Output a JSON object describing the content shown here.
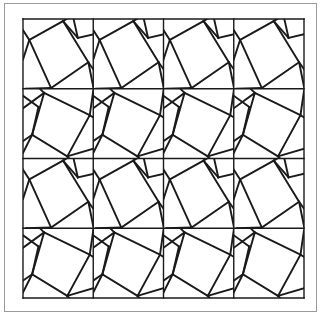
{
  "figure": {
    "background_color": "#ffffff",
    "line_color": "#1a1a1a",
    "frame_color": "#9a9a9a",
    "outer_frame": {
      "x": 4,
      "y": 3,
      "width": 313,
      "height": 309,
      "stroke_width": 1
    },
    "grid": {
      "x": 23,
      "y": 19,
      "width": 281,
      "height": 279,
      "columns": 4,
      "rows": 4,
      "cell_width": 70.25,
      "cell_height": 69.75,
      "stroke_width": 1.4
    },
    "motifs": {
      "A": {
        "name": "rotated-quad-clockwise",
        "rows": [
          0,
          2
        ],
        "quad": [
          [
            0.09,
            0.3
          ],
          [
            0.57,
            0.03
          ],
          [
            0.93,
            0.62
          ],
          [
            0.4,
            0.99
          ]
        ],
        "rays": [
          [
            [
              0.09,
              0.3
            ],
            [
              0.0,
              0.16
            ]
          ],
          [
            [
              0.57,
              0.03
            ],
            [
              0.62,
              0.0
            ]
          ],
          [
            [
              0.93,
              0.62
            ],
            [
              1.0,
              0.72
            ]
          ],
          [
            [
              0.4,
              0.99
            ],
            [
              0.36,
              1.0
            ]
          ],
          [
            [
              0.57,
              0.03
            ],
            [
              0.78,
              0.27
            ]
          ],
          [
            [
              0.78,
              0.27
            ],
            [
              1.0,
              0.22
            ]
          ],
          [
            [
              0.78,
              0.27
            ],
            [
              0.72,
              0.0
            ]
          ],
          [
            [
              0.93,
              0.62
            ],
            [
              1.0,
              0.97
            ]
          ],
          [
            [
              0.09,
              0.3
            ],
            [
              0.0,
              0.58
            ]
          ],
          [
            [
              0.4,
              0.99
            ],
            [
              0.04,
              1.0
            ]
          ]
        ]
      },
      "B": {
        "name": "rotated-quad-counterclockwise",
        "rows": [
          1,
          3
        ],
        "quad": [
          [
            0.3,
            0.06
          ],
          [
            0.95,
            0.38
          ],
          [
            0.63,
            0.97
          ],
          [
            0.13,
            0.66
          ]
        ],
        "rays": [
          [
            [
              0.3,
              0.06
            ],
            [
              0.24,
              0.0
            ]
          ],
          [
            [
              0.95,
              0.38
            ],
            [
              1.0,
              0.41
            ]
          ],
          [
            [
              0.63,
              0.97
            ],
            [
              0.66,
              1.0
            ]
          ],
          [
            [
              0.13,
              0.66
            ],
            [
              0.0,
              0.75
            ]
          ],
          [
            [
              0.3,
              0.06
            ],
            [
              0.0,
              0.28
            ]
          ],
          [
            [
              0.13,
              0.66
            ],
            [
              0.22,
              0.26
            ]
          ],
          [
            [
              0.22,
              0.26
            ],
            [
              0.0,
              0.1
            ]
          ],
          [
            [
              0.13,
              0.66
            ],
            [
              0.0,
              0.92
            ]
          ],
          [
            [
              0.63,
              0.97
            ],
            [
              1.0,
              0.86
            ]
          ],
          [
            [
              0.95,
              0.38
            ],
            [
              1.0,
              0.03
            ]
          ]
        ]
      }
    }
  }
}
